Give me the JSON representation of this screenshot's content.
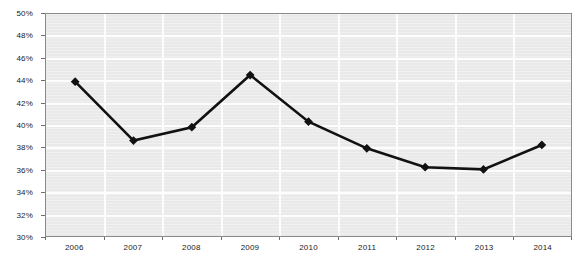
{
  "chart_data": {
    "type": "line",
    "title": "",
    "xlabel": "",
    "ylabel": "",
    "categories": [
      "2006",
      "2007",
      "2008",
      "2009",
      "2010",
      "2011",
      "2012",
      "2013",
      "2014"
    ],
    "values": [
      43.9,
      38.6,
      39.8,
      44.5,
      40.3,
      37.9,
      36.2,
      36.0,
      38.2
    ],
    "value_suffix": "%",
    "ylim": [
      30,
      50
    ],
    "y_tick_step": 2,
    "y_tick_labels": [
      "50%",
      "48%",
      "46%",
      "44%",
      "42%",
      "40%",
      "38%",
      "36%",
      "34%",
      "32%",
      "30%"
    ],
    "y_tick_values": [
      50,
      48,
      46,
      44,
      42,
      40,
      38,
      36,
      34,
      32,
      30
    ],
    "x_tick_labels": [
      "2006",
      "2007",
      "2008",
      "2009",
      "2010",
      "2011",
      "2012",
      "2013",
      "2014"
    ],
    "grid": "horizontal-and-vertical",
    "legend": "none",
    "series": [
      {
        "name": "Series 1",
        "values": [
          43.9,
          38.6,
          39.8,
          44.5,
          40.3,
          37.9,
          36.2,
          36.0,
          38.2
        ],
        "line_color": "#111111",
        "marker": "diamond",
        "marker_color": "#111111"
      }
    ],
    "colors": {
      "plot_background": "#ececec",
      "gridline": "#fdfdfd",
      "axis_border": "#8a8a8a",
      "line": "#111111",
      "marker": "#111111",
      "tick_text": "#1a1a1a",
      "page_background": "#ffffff"
    }
  },
  "meta": {
    "plot_left_px": 45,
    "plot_top_px": 13,
    "plot_width_px": 527,
    "plot_height_px": 224
  }
}
